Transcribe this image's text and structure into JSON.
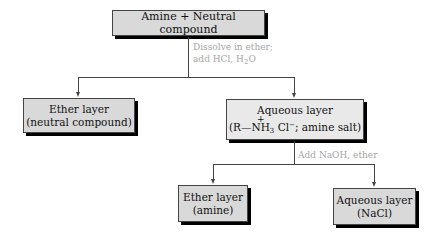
{
  "diagram": {
    "type": "flowchart",
    "nodes": {
      "start": {
        "label": "Amine + Neutral compound"
      },
      "ether_layer_1": {
        "line1": "Ether layer",
        "line2": "(neutral compound)"
      },
      "aqueous_layer_1": {
        "line1": "Aqueous layer",
        "line2_prefix": "(R—",
        "line2_charge": "+",
        "line2_n": "NH",
        "line2_sub": "3",
        "line2_cl": " Cl",
        "line2_sup": "−",
        "line2_suffix": "; amine salt)"
      },
      "ether_layer_2": {
        "line1": "Ether layer",
        "line2": "(amine)"
      },
      "aqueous_layer_2": {
        "line1": "Aqueous layer",
        "line2": "(NaCl)"
      }
    },
    "steps": {
      "step1_line1": "Dissolve in ether;",
      "step1_line2_prefix": "add HCl, H",
      "step1_line2_sub": "2",
      "step1_line2_suffix": "O",
      "step2": "Add NaOH, ether"
    },
    "colors": {
      "box_fill": "#d9d9d9",
      "box_fill_light": "#e9e9e9",
      "shadow": "#000000",
      "note_text": "#a6a6a6",
      "line": "#444444"
    }
  }
}
